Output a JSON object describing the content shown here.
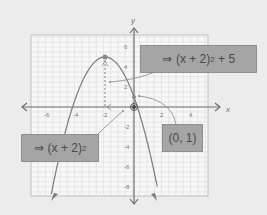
{
  "graph": {
    "axis_labels": {
      "x": "x",
      "y": "y"
    },
    "x_ticks": [
      {
        "value": -6,
        "label": "-6"
      },
      {
        "value": -4,
        "label": "-4"
      },
      {
        "value": -2,
        "label": "-2"
      },
      {
        "value": 2,
        "label": "2"
      },
      {
        "value": 4,
        "label": "4"
      }
    ],
    "y_ticks": [
      {
        "value": 6,
        "label": "6"
      },
      {
        "value": 4,
        "label": "4"
      },
      {
        "value": 2,
        "label": "2"
      },
      {
        "value": -2,
        "label": "-2"
      },
      {
        "value": -4,
        "label": "-4"
      },
      {
        "value": -6,
        "label": "-6"
      },
      {
        "value": -8,
        "label": "-8"
      }
    ],
    "x_range": [
      -7,
      5
    ],
    "y_range": [
      -9,
      7
    ],
    "curve": {
      "equation": "y = -(x + 2)^2 + 5",
      "vertex": [
        -2,
        5
      ],
      "y_intercept": [
        0,
        1
      ]
    }
  },
  "labels": {
    "step2": {
      "arrow": "⇒",
      "base": "(x + 2)",
      "exp": "2",
      "suffix": " + 5"
    },
    "step1": {
      "arrow": "⇒",
      "base": "(x + 2)",
      "exp": "2",
      "suffix": ""
    },
    "point": {
      "text": "(0, 1)"
    }
  },
  "colors": {
    "background": "#ececec",
    "grid_bg": "#f7f7f7",
    "grid_line": "#dcdcdc",
    "axis": "#6e6e6e",
    "curve": "#7a7a7a",
    "label_fill": "#a5a5a5",
    "text": "#4a4a4a"
  }
}
